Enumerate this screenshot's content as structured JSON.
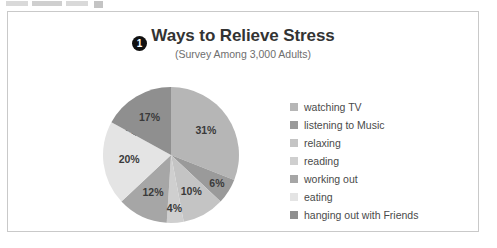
{
  "toolbar_fragment": {
    "present": true
  },
  "panel": {
    "background": "#ffffff",
    "border_color": "#c9c9c9"
  },
  "header": {
    "title": "Ways to Relieve Stress",
    "subtitle": "(Survey Among 3,000 Adults)"
  },
  "callouts": [
    {
      "id": "callout-1",
      "label": "1"
    },
    {
      "id": "callout-2",
      "label": "2"
    },
    {
      "id": "callout-3",
      "label": "3"
    }
  ],
  "chart_data": {
    "type": "pie",
    "title": "Ways to Relieve Stress",
    "subtitle": "(Survey Among 3,000 Adults)",
    "xlabel": "",
    "ylabel": "",
    "legend_position": "right",
    "start_angle_deg": 0,
    "direction": "clockwise",
    "categories": [
      "watching TV",
      "listening to Music",
      "relaxing",
      "reading",
      "working out",
      "eating",
      "hanging out with Friends"
    ],
    "values": [
      31,
      6,
      10,
      4,
      12,
      20,
      17
    ],
    "value_labels": [
      "31%",
      "6%",
      "10%",
      "4%",
      "12%",
      "20%",
      "17%"
    ],
    "colors": [
      "#b6b6b6",
      "#9a9a9a",
      "#c4c4c4",
      "#cfcfcf",
      "#a6a6a6",
      "#e4e4e4",
      "#8f8f8f"
    ],
    "label_color": "#3a3a3a",
    "total_respondents": "3,000"
  }
}
